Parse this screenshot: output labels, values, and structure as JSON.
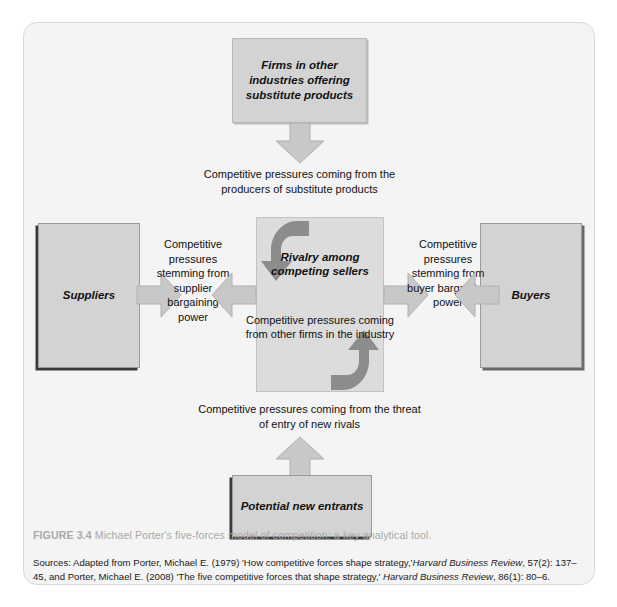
{
  "figure": {
    "label": "FIGURE 3.4",
    "caption": "Michael Porter's five-forces model of competition: a key analytical tool.",
    "sources_prefix": "Sources: Adapted from Porter, Michael E. (1979) 'How competitive forces shape strategy,'",
    "sources_journal_1": "Harvard Business Review",
    "sources_mid": ", 57(2): 137–45, and Porter, Michael E. (2008) 'The five competitive forces that shape strategy,'",
    "sources_journal_2": "Harvard Business Review",
    "sources_end": ", 86(1): 80–6."
  },
  "nodes": {
    "substitutes": "Firms in other industries offering substitute products",
    "suppliers": "Suppliers",
    "buyers": "Buyers",
    "new_entrants": "Potential new entrants",
    "rivalry_title": "Rivalry among competing sellers",
    "rivalry_body": "Competitive pressures coming from other firms in the industry"
  },
  "edge_labels": {
    "substitutes_to_rivalry": "Competitive pressures coming from the producers of substitute products",
    "suppliers_to_rivalry": "Competitive pressures stemming from supplier bargaining power",
    "buyers_to_rivalry": "Competitive pressures stemming from buyer bargaining power",
    "entrants_to_rivalry": "Competitive pressures coming from the threat of entry of new rivals"
  },
  "colors": {
    "card_bg": "#f4f4f4",
    "box_fill": "#d3d3d3",
    "rivalry_fill": "#dcdcdc",
    "arrow_fill": "#c8c8c8",
    "curved_arrow_fill": "#8c8c8c",
    "caption_gray": "#a9a9a9"
  }
}
